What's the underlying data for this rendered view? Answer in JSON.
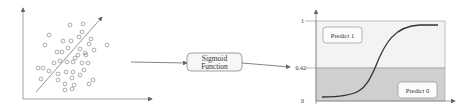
{
  "scatter_panel": {
    "points": [
      [
        70,
        25
      ],
      [
        83,
        24
      ],
      [
        49,
        35
      ],
      [
        82,
        32
      ],
      [
        45,
        45
      ],
      [
        63,
        41
      ],
      [
        71,
        41
      ],
      [
        79,
        37
      ],
      [
        91,
        39
      ],
      [
        107,
        45
      ],
      [
        89,
        44
      ],
      [
        80,
        49
      ],
      [
        94,
        50
      ],
      [
        57,
        52
      ],
      [
        62,
        52
      ],
      [
        68,
        48
      ],
      [
        85,
        53
      ],
      [
        78,
        55
      ],
      [
        86,
        55
      ],
      [
        54,
        63
      ],
      [
        60,
        61
      ],
      [
        67,
        62
      ],
      [
        73,
        62
      ],
      [
        75,
        58
      ],
      [
        82,
        63
      ],
      [
        88,
        63
      ],
      [
        38,
        68
      ],
      [
        43,
        68
      ],
      [
        49,
        71
      ],
      [
        58,
        74
      ],
      [
        66,
        72
      ],
      [
        73,
        72
      ],
      [
        84,
        70
      ],
      [
        80,
        75
      ],
      [
        41,
        79
      ],
      [
        58,
        80
      ],
      [
        72,
        78
      ],
      [
        93,
        80
      ],
      [
        65,
        84
      ],
      [
        74,
        85
      ],
      [
        89,
        84
      ],
      [
        65,
        90
      ],
      [
        72,
        89
      ]
    ],
    "regression_line": {
      "x1": 36,
      "y1": 92,
      "x2": 102,
      "y2": 17
    }
  },
  "function_box": {
    "line1": "Sigmoid",
    "line2": "Function"
  },
  "sigmoid_panel": {
    "y_ticks": {
      "top": "1",
      "threshold": "0.42",
      "bottom": "0"
    },
    "region_upper_label": "Predict 1",
    "region_lower_label": "Predict 0",
    "colors": {
      "upper_region": "#f3f3f3",
      "lower_region": "#cfcfcf",
      "curve": "#333333"
    }
  }
}
